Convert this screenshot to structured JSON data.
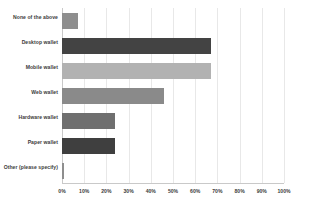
{
  "chart_data": {
    "type": "bar",
    "orientation": "horizontal",
    "title": "",
    "xlabel": "",
    "ylabel": "",
    "xlim": [
      0,
      100
    ],
    "grid": true,
    "legend": false,
    "legend_position": "none",
    "categories": [
      "None of the above",
      "Desktop wallet",
      "Mobile wallet",
      "Web wallet",
      "Hardware wallet",
      "Paper wallet",
      "Other (please specify)"
    ],
    "values": [
      7,
      67,
      67,
      46,
      24,
      24,
      1
    ],
    "tick_labels": [
      "0%",
      "10%",
      "20%",
      "30%",
      "40%",
      "50%",
      "60%",
      "70%",
      "80%",
      "90%",
      "100%"
    ],
    "tick_values": [
      0,
      10,
      20,
      30,
      40,
      50,
      60,
      70,
      80,
      90,
      100
    ],
    "bar_colors": [
      "#8e8e8e",
      "#434343",
      "#b2b2b2",
      "#8a8a8a",
      "#6f6f6f",
      "#3f3f3f",
      "#8e8e8e"
    ],
    "grid_color": "#e8e8e8",
    "axis_color": "#c9c9c9",
    "background_color": "#ffffff",
    "text_color": "#3a3a3a"
  }
}
